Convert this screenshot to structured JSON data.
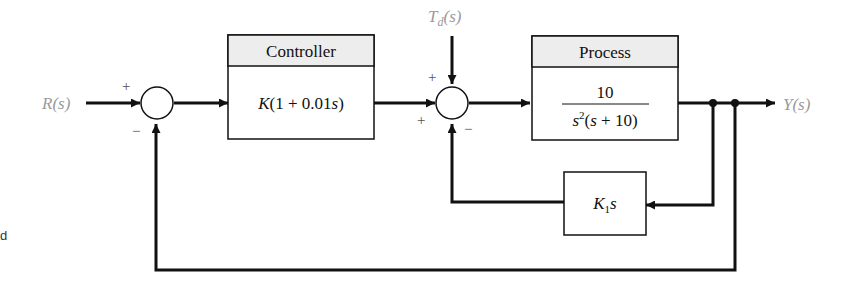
{
  "diagram": {
    "type": "feedback control block diagram",
    "signals": {
      "input": "R(s)",
      "output": "Y(s)",
      "disturbance": "T_d(s)"
    },
    "blocks": [
      {
        "id": "controller",
        "header": "Controller",
        "transfer_function": "K(1 + 0.01s)"
      },
      {
        "id": "process",
        "header": "Process",
        "numerator": "10",
        "denominator": "s²(s + 10)"
      },
      {
        "id": "inner-feedback",
        "transfer_function": "K₁s"
      }
    ],
    "summing_junctions": [
      {
        "id": "sum1",
        "signs": {
          "input": "+",
          "feedback": "−"
        }
      },
      {
        "id": "sum2",
        "signs": {
          "disturbance": "+",
          "forward": "+",
          "feedback": "−"
        }
      }
    ],
    "left_fragment": "d",
    "colors": {
      "line": "#111111",
      "header_fill": "#ededed",
      "signal_label": "#9a9a9a"
    }
  }
}
